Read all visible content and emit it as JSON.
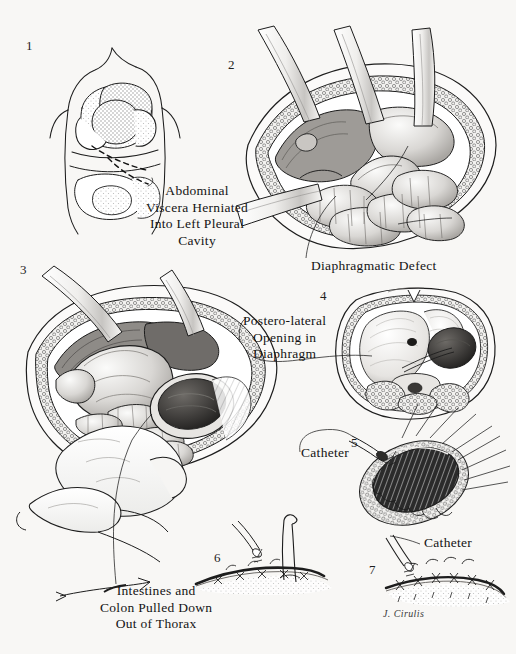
{
  "plate": {
    "width": 516,
    "height": 654,
    "background_color": "#f8f7f5",
    "ink_color": "#1a1a1a",
    "subject": "Congenital posterolateral diaphragmatic hernia repair",
    "signature": "J. Cirulis"
  },
  "panels": [
    {
      "number": "1",
      "name": "torso-overview",
      "caption": "Abdominal\nViscera Herniated\nInto Left Pleural\nCavity",
      "caption_align": "center"
    },
    {
      "number": "2",
      "name": "thoracotomy-exposure",
      "caption": "Diaphragmatic Defect",
      "caption_align": "left"
    },
    {
      "number": "3",
      "name": "viscera-reduction",
      "caption": "Intestines and\nColon Pulled Down\nOut of Thorax",
      "caption_align": "center"
    },
    {
      "number": "4",
      "name": "cross-section",
      "caption": "Postero-lateral\nOpening in\nDiaphragm",
      "caption_align": "center"
    },
    {
      "number": "5",
      "name": "defect-with-catheter",
      "caption": "Catheter",
      "caption_align": "left"
    },
    {
      "number": "6",
      "name": "suture-closure",
      "caption": "",
      "caption_align": "left"
    },
    {
      "number": "7",
      "name": "completed-closure",
      "caption": "Catheter",
      "caption_align": "left"
    }
  ]
}
